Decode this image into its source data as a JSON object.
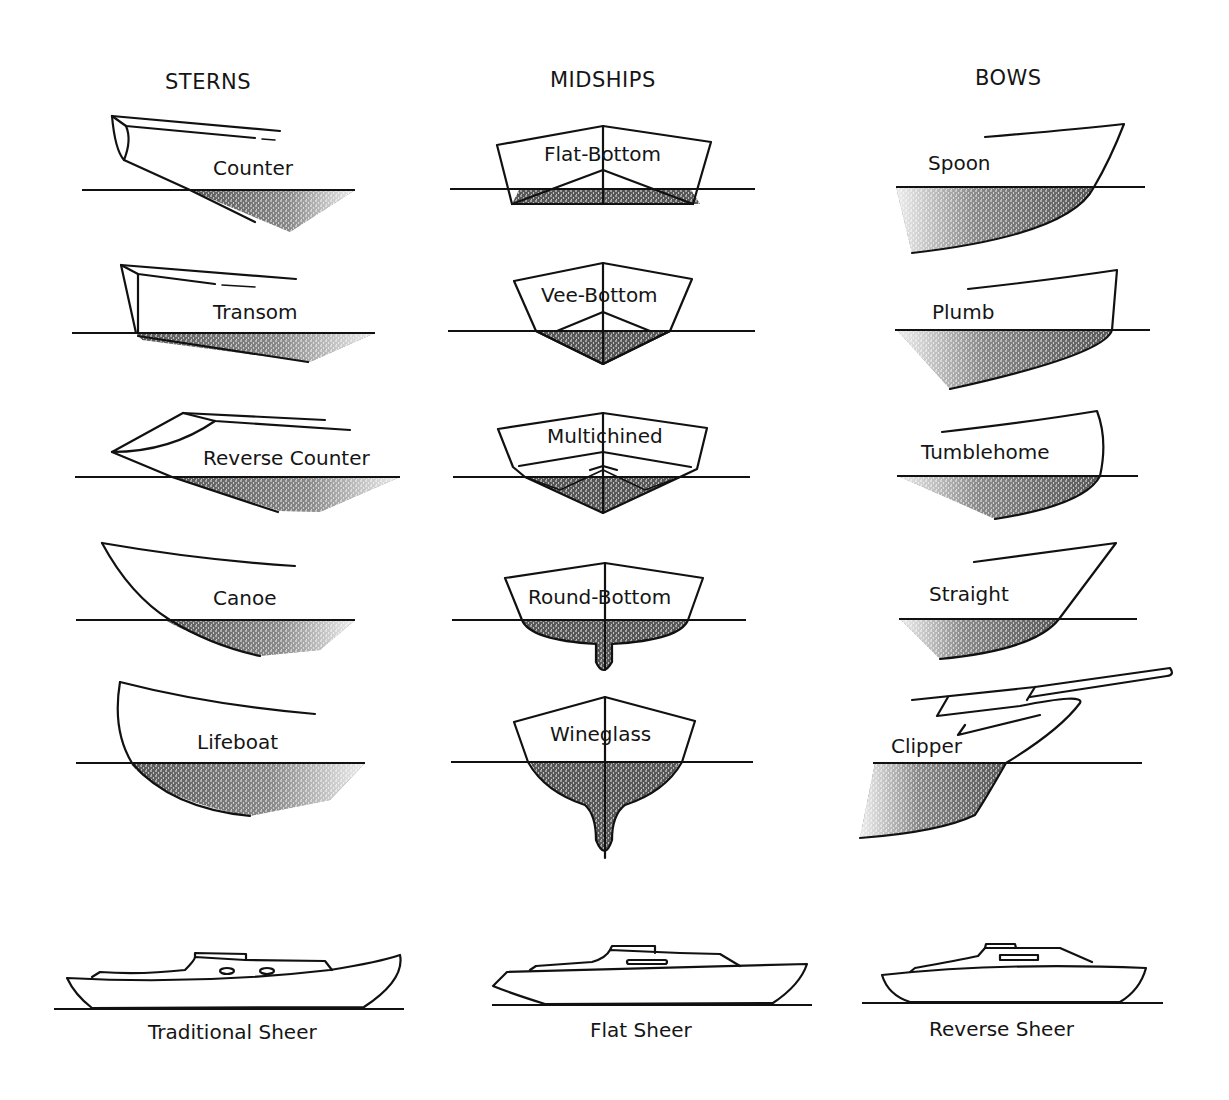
{
  "columns": [
    {
      "key": "sterns",
      "title": "STERNS"
    },
    {
      "key": "midships",
      "title": "MIDSHIPS"
    },
    {
      "key": "bows",
      "title": "BOWS"
    }
  ],
  "sterns": [
    {
      "label": "Counter"
    },
    {
      "label": "Transom"
    },
    {
      "label": "Reverse Counter"
    },
    {
      "label": "Canoe"
    },
    {
      "label": "Lifeboat"
    }
  ],
  "midships": [
    {
      "label": "Flat-Bottom"
    },
    {
      "label": "Vee-Bottom"
    },
    {
      "label": "Multichined"
    },
    {
      "label": "Round-Bottom"
    },
    {
      "label": "Wineglass"
    }
  ],
  "bows": [
    {
      "label": "Spoon"
    },
    {
      "label": "Plumb"
    },
    {
      "label": "Tumblehome"
    },
    {
      "label": "Straight"
    },
    {
      "label": "Clipper"
    }
  ],
  "sheers": [
    {
      "label": "Traditional Sheer"
    },
    {
      "label": "Flat Sheer"
    },
    {
      "label": "Reverse Sheer"
    }
  ],
  "colors": {
    "ink": "#111111",
    "background": "#ffffff",
    "shading": "#2a2a2a"
  }
}
